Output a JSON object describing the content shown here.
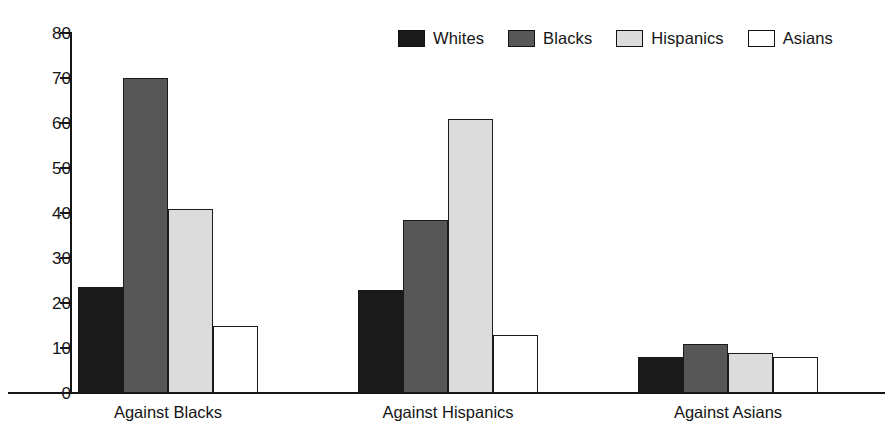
{
  "chart_data": {
    "type": "bar",
    "title": "",
    "subtitle": "",
    "xlabel": "",
    "ylabel": "",
    "categories": [
      "Against Blacks",
      "Against Hispanics",
      "Against Asians"
    ],
    "series": [
      {
        "name": "Whites",
        "color": "#1a1a1a",
        "values": [
          23.5,
          23.0,
          8.0
        ]
      },
      {
        "name": "Blacks",
        "color": "#575757",
        "values": [
          70.0,
          38.5,
          11.0
        ]
      },
      {
        "name": "Hispanics",
        "color": "#dcdcdc",
        "values": [
          41.0,
          61.0,
          9.0
        ]
      },
      {
        "name": "Asians",
        "color": "#ffffff",
        "values": [
          15.0,
          13.0,
          8.0
        ]
      }
    ],
    "ylim": [
      0,
      80
    ],
    "yticks": [
      0,
      10,
      20,
      30,
      40,
      50,
      60,
      70,
      80
    ],
    "ytick_labels": [
      "0",
      "10",
      "20",
      "30",
      "40",
      "50",
      "60",
      "70",
      "80"
    ],
    "grid": false,
    "legend_position": "top-right",
    "legend_entries": [
      "Whites",
      "Blacks",
      "Hispanics",
      "Asians"
    ]
  },
  "legend": {
    "items": [
      {
        "label": "Whites"
      },
      {
        "label": "Blacks"
      },
      {
        "label": "Hispanics"
      },
      {
        "label": "Asians"
      }
    ]
  },
  "axis": {
    "y_labels": [
      "80",
      "70",
      "60",
      "50",
      "40",
      "30",
      "20",
      "10",
      "0"
    ],
    "x_labels": [
      "Against Blacks",
      "Against Hispanics",
      "Against Asians"
    ]
  }
}
